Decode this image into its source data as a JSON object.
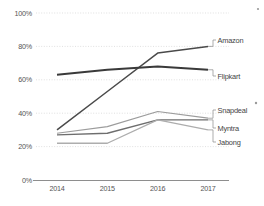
{
  "chart_data": {
    "type": "line",
    "title": "",
    "subtitle": "",
    "xlabel": "",
    "ylabel": "",
    "categories": [
      "2014",
      "2015",
      "2016",
      "2017"
    ],
    "x": [
      2014,
      2015,
      2016,
      2017
    ],
    "ylim": [
      0,
      100
    ],
    "yticks": [
      0,
      20,
      40,
      60,
      80,
      100
    ],
    "ytick_labels": [
      "0%",
      "20%",
      "40%",
      "60%",
      "80%",
      "100%"
    ],
    "xtick_labels": [
      "2014",
      "2015",
      "2016",
      "2017"
    ],
    "grid": true,
    "grid_style": "dotted-horizontal",
    "legend_position": "right-inline-labels",
    "value_format": "percent",
    "series": [
      {
        "name": "Amazon",
        "label": "Amazon",
        "color": "#4a4a4a",
        "width": 1.5,
        "values": [
          30,
          53,
          76,
          80
        ]
      },
      {
        "name": "Flipkart",
        "label": "Flipkart",
        "color": "#3a3a3a",
        "width": 1.9,
        "values": [
          63,
          66,
          68,
          66
        ]
      },
      {
        "name": "Snapdeal",
        "label": "Snapdeal",
        "color": "#9c9c9c",
        "width": 1.2,
        "values": [
          28,
          32,
          41,
          37
        ]
      },
      {
        "name": "Myntra",
        "label": "Myntra",
        "color": "#6e6e6e",
        "width": 1.4,
        "values": [
          27,
          28,
          36,
          36
        ]
      },
      {
        "name": "Jabong",
        "label": "Jabong",
        "color": "#adadad",
        "width": 1.3,
        "values": [
          22,
          22,
          36,
          30
        ]
      }
    ]
  },
  "axes": {
    "y_axis_name": "percentage-axis",
    "x_axis_name": "year-axis"
  }
}
